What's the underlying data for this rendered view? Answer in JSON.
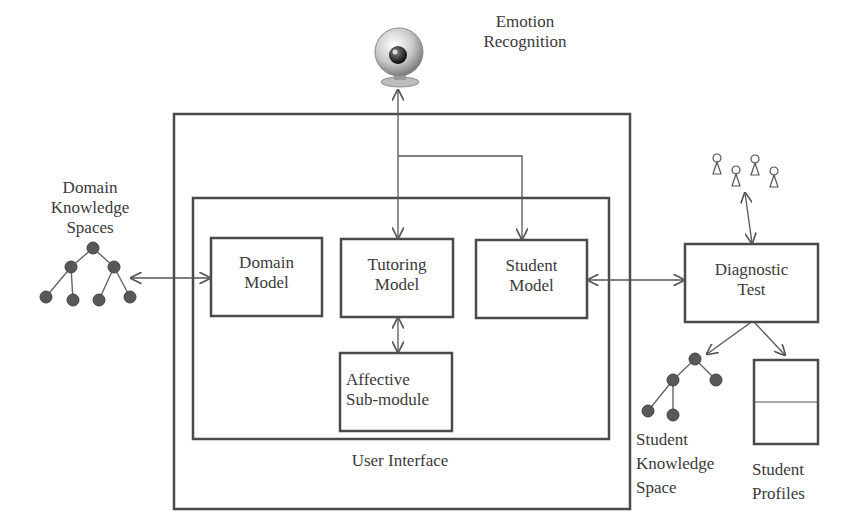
{
  "diagram": {
    "title_labels": {
      "emotion_recognition": [
        "Emotion",
        "Recognition"
      ],
      "domain_knowledge_spaces": [
        "Domain",
        "Knowledge",
        "Spaces"
      ]
    },
    "outer_frame_label": "User Interface",
    "modules": {
      "domain_model": [
        "Domain",
        "Model"
      ],
      "tutoring_model": [
        "Tutoring",
        "Model"
      ],
      "student_model": [
        "Student",
        "Model"
      ],
      "affective_submodule": [
        "Affective",
        "Sub-module"
      ]
    },
    "external": {
      "diagnostic_test": [
        "Diagnostic",
        "Test"
      ],
      "student_knowledge_space": [
        "Student",
        "Knowledge",
        "Space"
      ],
      "student_profiles": [
        "Student",
        "Profiles"
      ]
    },
    "icons": {
      "webcam": "webcam-icon",
      "students": "students-group-icon",
      "tree": "tree-icon",
      "profile_doc": "profile-document-icon"
    },
    "colors": {
      "line": "#4a4a4a",
      "node": "#555555",
      "text": "#3a3a3a"
    }
  }
}
